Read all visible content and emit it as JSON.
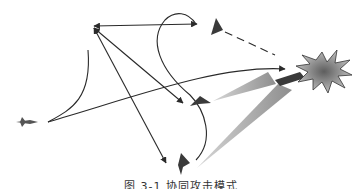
{
  "figure": {
    "caption": "图 3-1  协同攻击模式",
    "colors": {
      "line": "#2a2a2a",
      "aircraft": "#3a3a3a",
      "beam": "#8a8a8a",
      "explosion_fill": "#9a9a9a",
      "explosion_core": "#6a6a6a"
    },
    "nodes": [
      {
        "id": "friendly-aircraft-left",
        "x": 22,
        "y": 122
      },
      {
        "id": "uav-top",
        "x": 215,
        "y": 28
      },
      {
        "id": "uav-middle",
        "x": 197,
        "y": 103
      },
      {
        "id": "uav-bottom",
        "x": 183,
        "y": 162
      },
      {
        "id": "control-node",
        "x": 93,
        "y": 27
      },
      {
        "id": "target-explosion",
        "x": 322,
        "y": 70
      }
    ]
  }
}
